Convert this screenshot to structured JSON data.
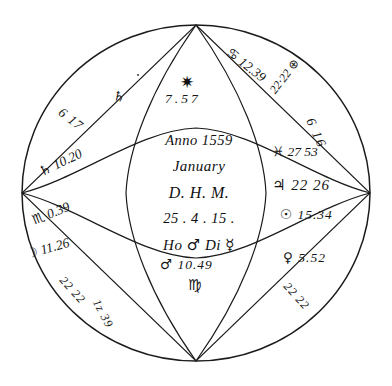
{
  "document": {
    "kind": "astrological-nativity-chart",
    "style": "handwritten-manuscript",
    "ink_color": "#1b1b1b",
    "background_color": "#ffffff"
  },
  "center_panel": {
    "line_anno": "Anno 1559",
    "line_month": "January",
    "line_dhm": "D. H. M.",
    "line_numbers": "25 . 4 . 15 .",
    "line_ho": "Ho",
    "glyph_mars": "♂",
    "line_di": "Di",
    "glyph_mercury": "☿"
  },
  "cusps": {
    "top": {
      "glyph": "♋",
      "value": "12.39"
    },
    "upper_right": {
      "value": "22·22",
      "glyph": "⊕"
    },
    "right_upper_outer": {
      "value": "6 16"
    },
    "right_pisces": {
      "glyph": "♓",
      "value": "27 53"
    },
    "right_jupiter": {
      "glyph": "♃",
      "value": "22 26"
    },
    "right_sun": {
      "glyph": "☉",
      "value": "15.34"
    },
    "lower_right_venus": {
      "glyph": "♀",
      "value": "5.52"
    },
    "bottom_mars": {
      "glyph": "♂",
      "value": "10.49",
      "sign": "♍"
    },
    "lower_left_moon": {
      "glyph": "☽",
      "value": "11.26"
    },
    "lower_left_extra": {
      "value": "22 22"
    },
    "left_scorpio": {
      "glyph": "♏",
      "value": "0.39"
    },
    "left_saturn": {
      "glyph": "♄",
      "value": "10.20"
    },
    "upper_left": {
      "value": "6 17"
    },
    "upper_left_inner": {
      "glyph": "♄"
    },
    "top_center_star": {
      "glyph": "✷",
      "value": "7.57"
    },
    "bottom_left_diag": {
      "value": "1z 39"
    },
    "bottom_center_diag": {
      "value": "22 22"
    }
  },
  "marks": {
    "ink_dot_upper_left": "•"
  }
}
